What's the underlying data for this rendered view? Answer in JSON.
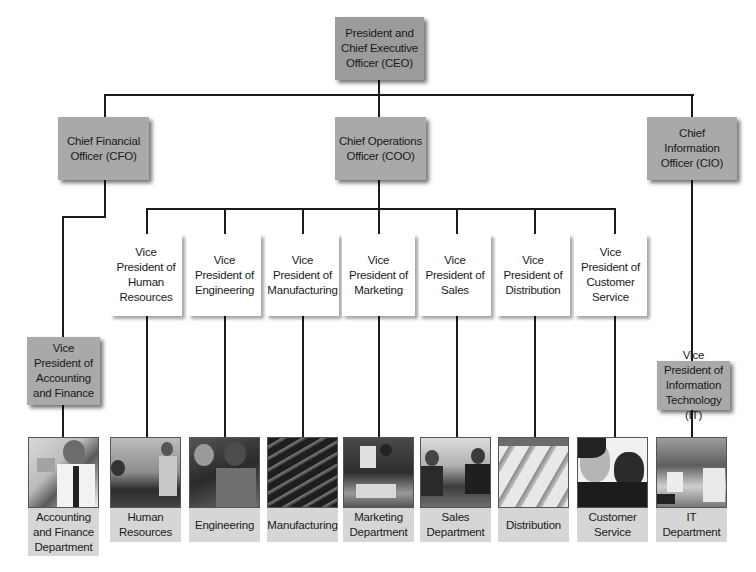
{
  "executive": {
    "ceo": "President and Chief Executive Officer (CEO)"
  },
  "chiefs": {
    "cfo": "Chief Financial Officer (CFO)",
    "coo": "Chief Operations Officer (COO)",
    "cio": "Chief Information Officer (CIO)"
  },
  "vps": {
    "accounting": "Vice President of Accounting and Finance",
    "it": "Vice President of Information Technology (IT)",
    "coo_reports": [
      {
        "label": "Vice President of Human Resources"
      },
      {
        "label": "Vice President of Engineering"
      },
      {
        "label": "Vice President of Manufacturing"
      },
      {
        "label": "Vice President of Marketing"
      },
      {
        "label": "Vice President of Sales"
      },
      {
        "label": "Vice President of Distribution"
      },
      {
        "label": "Vice President of Customer Service"
      }
    ]
  },
  "departments": [
    {
      "label": "Accounting and Finance Department",
      "photo": "office-worker-photo"
    },
    {
      "label": "Human Resources",
      "photo": "meeting-handshake-photo"
    },
    {
      "label": "Engineering",
      "photo": "engineers-photo"
    },
    {
      "label": "Manufacturing",
      "photo": "factory-floor-photo"
    },
    {
      "label": "Marketing Department",
      "photo": "presentation-photo"
    },
    {
      "label": "Sales Department",
      "photo": "sales-handshake-photo"
    },
    {
      "label": "Distribution",
      "photo": "warehouse-photo"
    },
    {
      "label": "Customer Service",
      "photo": "headset-agents-photo"
    },
    {
      "label": "IT Department",
      "photo": "computer-room-photo"
    }
  ],
  "colors": {
    "executive_box": "#a9a9a9",
    "vp_box": "#ffffff",
    "dept_label_bg": "#d6d6d6",
    "connector": "#1a1a1a"
  }
}
